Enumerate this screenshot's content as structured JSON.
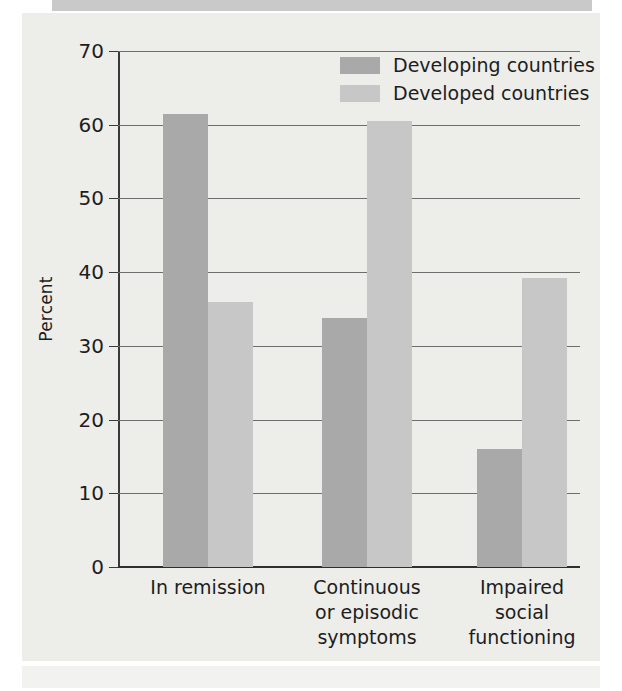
{
  "chart_data": {
    "type": "bar",
    "title": "",
    "xlabel": "",
    "ylabel": "Percent",
    "ylim": [
      0,
      70
    ],
    "ytick_step": 10,
    "yticks": [
      70,
      60,
      50,
      40,
      30,
      20,
      10,
      0
    ],
    "ytick_labels": [
      "70",
      "60",
      "50",
      "40",
      "30",
      "20",
      "10",
      "0"
    ],
    "grid": true,
    "grid_axis": "y",
    "legend_position": "top-right",
    "categories": [
      "In remission",
      "Continuous\nor episodic\nsymptoms",
      "Impaired\nsocial\nfunctioning"
    ],
    "series": [
      {
        "name": "Developing countries",
        "color": "#a9a9a9",
        "values": [
          61.5,
          33.8,
          16.0
        ]
      },
      {
        "name": "Developed countries",
        "color": "#c7c7c7",
        "values": [
          36.0,
          60.5,
          39.2
        ]
      }
    ]
  },
  "colors": {
    "developing": "#a9a9a9",
    "developed": "#c7c7c7",
    "page_background": "#ededea",
    "axis": "#2f2f2f",
    "gridline": "#6d6d6d",
    "text": "#1d1d1d"
  }
}
